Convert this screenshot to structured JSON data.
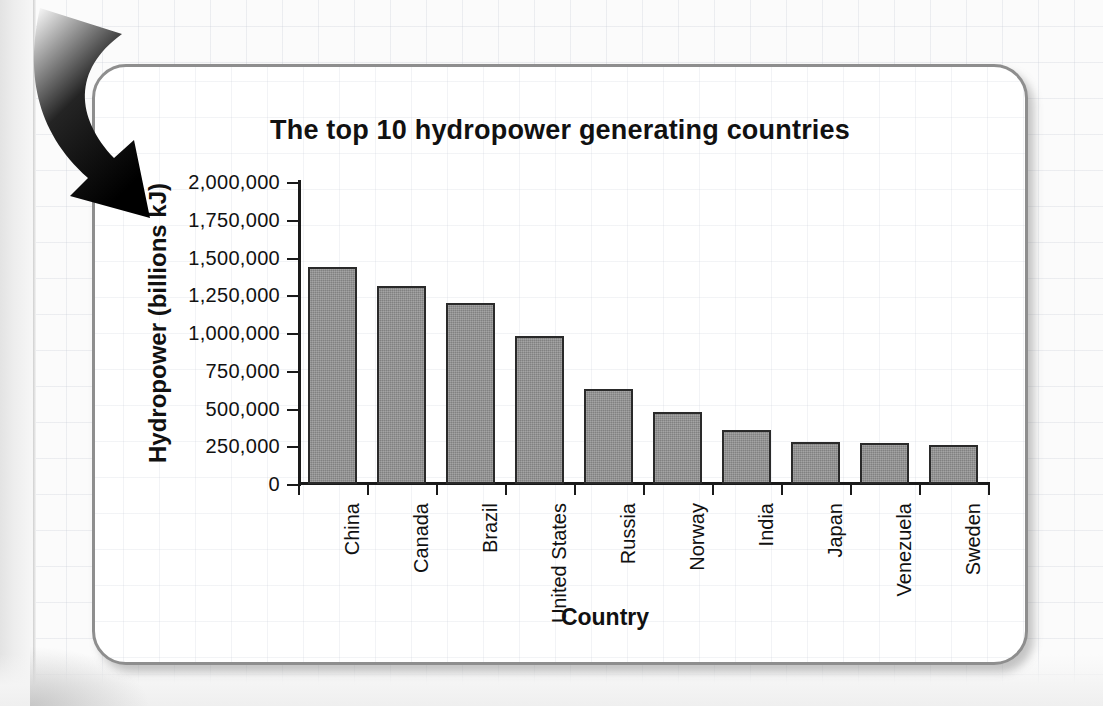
{
  "figure": {
    "panel_border_color": "#8e8e8e",
    "background_color": "#ffffff",
    "bar_fill_color": "#8f8f8f",
    "bar_outline_color": "#2a2a2a",
    "axis_color": "#1a1a1a"
  },
  "annotation": {
    "arrow_name": "curved-down-arrow",
    "arrow_color": "#000000"
  },
  "chart_data": {
    "type": "bar",
    "title": "The top 10 hydropower generating countries",
    "xlabel": "Country",
    "ylabel": "Hydropower (billions kJ)",
    "categories": [
      "China",
      "Canada",
      "Brazil",
      "United States",
      "Russia",
      "Norway",
      "India",
      "Japan",
      "Venezuela",
      "Sweden"
    ],
    "values": [
      1440000,
      1310000,
      1200000,
      980000,
      630000,
      480000,
      355000,
      280000,
      272000,
      258000
    ],
    "ylim": [
      0,
      2000000
    ],
    "ytick_values": [
      0,
      250000,
      500000,
      750000,
      1000000,
      1250000,
      1500000,
      1750000,
      2000000
    ],
    "ytick_labels": [
      "0",
      "250,000",
      "500,000",
      "750,000",
      "1,000,000",
      "1,250,000",
      "1,500,000",
      "1,750,000",
      "2,000,000"
    ],
    "grid": false,
    "legend": null
  }
}
